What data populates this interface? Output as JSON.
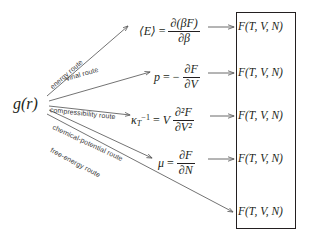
{
  "diagram": {
    "background_color": "#ffffff",
    "line_color": "#5a5a5a",
    "text_color": "#231f20",
    "source": {
      "label": "g(r)",
      "name": "pair-distribution-function"
    },
    "routes": [
      {
        "id": "energy",
        "label": "energy route"
      },
      {
        "id": "virial",
        "label": "virial route"
      },
      {
        "id": "compressibility",
        "label": "compressibility route"
      },
      {
        "id": "chemical-potential",
        "label": "chemical-potential route"
      },
      {
        "id": "free-energy",
        "label": "free-energy route"
      }
    ],
    "equations": [
      {
        "id": "energy-equation",
        "lhs": "⟨E⟩",
        "relation": "=",
        "numerator": "∂(βF)",
        "denominator": "∂β",
        "plain": "⟨E⟩ = ∂(βF)/∂β"
      },
      {
        "id": "virial-equation",
        "lhs": "p",
        "relation": "=",
        "sign": "−",
        "numerator": "∂F",
        "denominator": "∂V",
        "plain": "p = −∂F/∂V"
      },
      {
        "id": "compressibility-equation",
        "lhs": "κ_T^{-1}",
        "relation": "=",
        "prefactor": "V",
        "numerator": "∂²F",
        "denominator": "∂V²",
        "plain": "κT⁻¹ = V ∂²F/∂V²"
      },
      {
        "id": "chemical-potential-equation",
        "lhs": "μ",
        "relation": "=",
        "numerator": "∂F",
        "denominator": "∂N",
        "plain": "μ = ∂F/∂N"
      }
    ],
    "outcomes": [
      {
        "label": "F(T, V, N)"
      },
      {
        "label": "F(T, V, N)"
      },
      {
        "label": "F(T, V, N)"
      },
      {
        "label": "F(T, V, N)"
      },
      {
        "label": "F(T, V, N)"
      }
    ],
    "connector_arrow": "⟶"
  }
}
